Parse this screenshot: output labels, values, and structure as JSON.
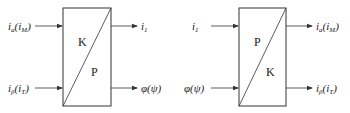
{
  "diagrams": [
    {
      "id": "left",
      "block": {
        "upper_label": "K",
        "lower_label": "P"
      },
      "inputs": [
        {
          "main": "i",
          "sub": "a",
          "paren_main": "i",
          "paren_sub": "M"
        },
        {
          "main": "i",
          "sub": "β",
          "paren_main": "i",
          "paren_sub": "T"
        }
      ],
      "outputs": [
        {
          "main": "i",
          "sub": "1"
        },
        {
          "text": "φ(ψ)"
        }
      ]
    },
    {
      "id": "right",
      "block": {
        "upper_label": "P",
        "lower_label": "K"
      },
      "inputs": [
        {
          "main": "i",
          "sub": "1"
        },
        {
          "text": "φ(ψ)"
        }
      ],
      "outputs": [
        {
          "main": "i",
          "sub": "a",
          "paren_main": "i",
          "paren_sub": "M"
        },
        {
          "main": "i",
          "sub": "β",
          "paren_main": "i",
          "paren_sub": "T"
        }
      ]
    }
  ],
  "colors": {
    "line": "#333333",
    "background": "#ffffff"
  }
}
